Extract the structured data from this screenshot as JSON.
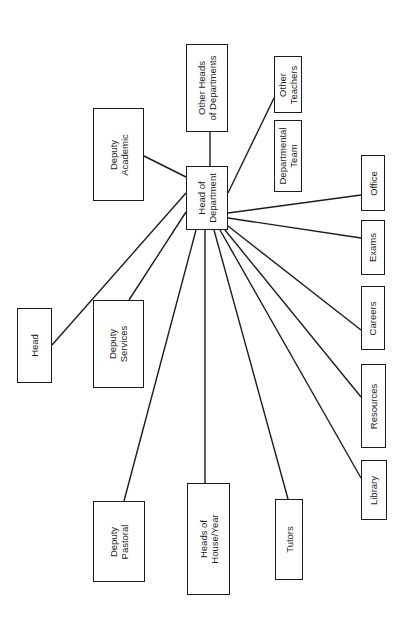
{
  "diagram": {
    "orientation": "rotated-90-ccw",
    "nodes": {
      "head": {
        "label": "Head",
        "box": [
          17,
          308,
          35,
          75
        ]
      },
      "deputy_academic": {
        "label": "Deputy\nAcademic",
        "box": [
          93,
          108,
          51,
          93
        ]
      },
      "deputy_services": {
        "label": "Deputy\nServices",
        "box": [
          93,
          300,
          51,
          88
        ]
      },
      "deputy_pastoral": {
        "label": "Deputy\nPastoral",
        "box": [
          93,
          501,
          52,
          81
        ]
      },
      "other_heads": {
        "label": "Other Heads\nof Departments",
        "box": [
          186,
          44,
          42,
          88
        ]
      },
      "head_of_department": {
        "label": "Head of\nDepartment",
        "box": [
          186,
          166,
          42,
          64
        ]
      },
      "heads_of_house_year": {
        "label": "Heads of\nHouse/Year",
        "box": [
          187,
          483,
          43,
          112
        ]
      },
      "tutors": {
        "label": "Tutors",
        "box": [
          275,
          499,
          28,
          81
        ]
      },
      "other_teachers": {
        "label": "Other\nTeachers",
        "box": [
          274,
          56,
          28,
          57
        ]
      },
      "departmental_team": {
        "label": "Departmental\nTeam",
        "box": [
          274,
          120,
          28,
          72
        ]
      },
      "office": {
        "label": "Office",
        "box": [
          361,
          155,
          24,
          56
        ]
      },
      "exams": {
        "label": "Exams",
        "box": [
          361,
          220,
          24,
          55
        ]
      },
      "careers": {
        "label": "Careers",
        "box": [
          361,
          286,
          24,
          64
        ]
      },
      "resources": {
        "label": "Resources",
        "box": [
          361,
          364,
          25,
          84
        ]
      },
      "library": {
        "label": "Library",
        "box": [
          361,
          460,
          26,
          60
        ]
      }
    },
    "edges": [
      {
        "from": "head_of_department",
        "to": "head",
        "points": [
          186,
          193,
          52,
          345
        ]
      },
      {
        "from": "head_of_department",
        "to": "deputy_academic",
        "points": [
          186,
          177,
          144,
          156
        ]
      },
      {
        "from": "head_of_department",
        "to": "deputy_services",
        "points": [
          186,
          212,
          129,
          300
        ]
      },
      {
        "from": "head_of_department",
        "to": "deputy_pastoral",
        "points": [
          196,
          230,
          124,
          501
        ]
      },
      {
        "from": "head_of_department",
        "to": "heads_of_house_year",
        "points": [
          205,
          230,
          205,
          483
        ]
      },
      {
        "from": "head_of_department",
        "to": "tutors",
        "points": [
          214,
          230,
          288,
          499
        ]
      },
      {
        "from": "head_of_department",
        "to": "library",
        "points": [
          220,
          230,
          361,
          478
        ]
      },
      {
        "from": "head_of_department",
        "to": "resources",
        "points": [
          225,
          230,
          361,
          397
        ]
      },
      {
        "from": "head_of_department",
        "to": "careers",
        "points": [
          228,
          226,
          361,
          330
        ]
      },
      {
        "from": "head_of_department",
        "to": "exams",
        "points": [
          228,
          218,
          361,
          238
        ]
      },
      {
        "from": "head_of_department",
        "to": "office",
        "points": [
          228,
          213,
          361,
          195
        ]
      },
      {
        "from": "head_of_department",
        "to": "other_teachers",
        "points": [
          228,
          193,
          274,
          98
        ]
      },
      {
        "from": "head_of_department",
        "to": "other_heads",
        "points": [
          210,
          166,
          210,
          132
        ]
      }
    ]
  }
}
